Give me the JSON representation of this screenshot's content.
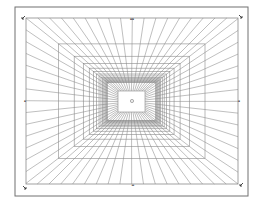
{
  "diagram": {
    "type": "perspective-grid",
    "line_color": "#8a8a8a",
    "frame_color": "#6e6e6e",
    "background": "#ffffff",
    "vanishing_point": "center",
    "radial_line_count": 64,
    "nested_rectangle_count": 14,
    "markers": {
      "top": "▪▪",
      "bottom": "▬",
      "left": "▪",
      "right": "▪"
    },
    "corner_icons": [
      "arrow-nw",
      "arrow-ne",
      "arrow-sw",
      "arrow-se"
    ],
    "center_icon": "target-circle"
  }
}
